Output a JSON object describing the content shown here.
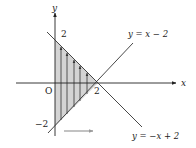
{
  "diagram": {
    "type": "integration-region",
    "colors": {
      "axis": "#222222",
      "line": "#333333",
      "region_fill": "#d4d4d4",
      "arrow_gray": "#9a9a9a",
      "interior_arrows": "#333333"
    },
    "axes": {
      "x_label": "x",
      "y_label": "y",
      "origin_label": "O"
    },
    "tick_labels": {
      "y_top": "2",
      "x_right": "2",
      "y_bottom": "−2"
    },
    "lines": [
      {
        "label": "y = x − 2"
      },
      {
        "label": "y = −x + 2"
      }
    ],
    "region": {
      "vertices": [
        [
          0,
          2
        ],
        [
          2,
          0
        ],
        [
          0,
          -2
        ]
      ],
      "interior_arrow_count": 5,
      "interior_arrow_direction": "up",
      "sweep_arrow_direction": "right"
    }
  }
}
